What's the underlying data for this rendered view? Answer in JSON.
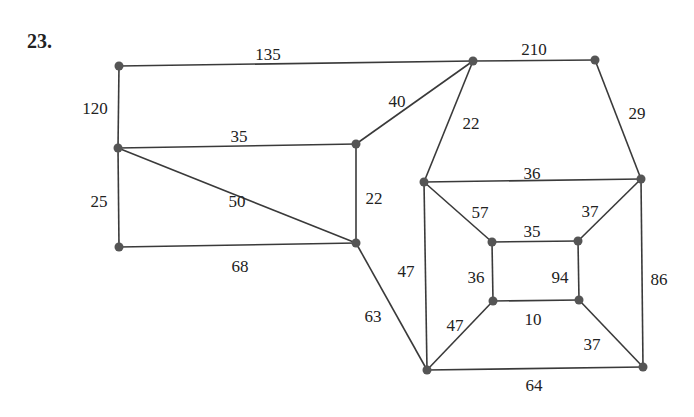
{
  "problem": {
    "number": "23."
  },
  "colors": {
    "edge": "#3a3a3a",
    "node": "#555555",
    "text": "#222222",
    "background": "#ffffff"
  },
  "graph": {
    "nodes": [
      {
        "id": "A",
        "x": 119,
        "y": 66
      },
      {
        "id": "B",
        "x": 473,
        "y": 61
      },
      {
        "id": "C",
        "x": 595,
        "y": 60
      },
      {
        "id": "D",
        "x": 118,
        "y": 148
      },
      {
        "id": "E",
        "x": 356,
        "y": 144
      },
      {
        "id": "F",
        "x": 424,
        "y": 182
      },
      {
        "id": "G",
        "x": 641,
        "y": 179
      },
      {
        "id": "H",
        "x": 119,
        "y": 247
      },
      {
        "id": "I",
        "x": 356,
        "y": 243
      },
      {
        "id": "J",
        "x": 492,
        "y": 242
      },
      {
        "id": "K",
        "x": 578,
        "y": 241
      },
      {
        "id": "L",
        "x": 493,
        "y": 301
      },
      {
        "id": "M",
        "x": 579,
        "y": 300
      },
      {
        "id": "N",
        "x": 427,
        "y": 370
      },
      {
        "id": "O",
        "x": 643,
        "y": 367
      }
    ],
    "edges": [
      {
        "from": "A",
        "to": "B",
        "weight": "135",
        "lx": 268,
        "ly": 56
      },
      {
        "from": "B",
        "to": "C",
        "weight": "210",
        "lx": 534,
        "ly": 51
      },
      {
        "from": "A",
        "to": "D",
        "weight": "120",
        "lx": 95,
        "ly": 110
      },
      {
        "from": "B",
        "to": "E",
        "weight": "40",
        "lx": 397,
        "ly": 103
      },
      {
        "from": "B",
        "to": "F",
        "weight": "22",
        "lx": 471,
        "ly": 125
      },
      {
        "from": "C",
        "to": "G",
        "weight": "29",
        "lx": 637,
        "ly": 115
      },
      {
        "from": "D",
        "to": "E",
        "weight": "35",
        "lx": 239,
        "ly": 138
      },
      {
        "from": "D",
        "to": "I",
        "weight": "50",
        "lx": 237,
        "ly": 203
      },
      {
        "from": "D",
        "to": "H",
        "weight": "25",
        "lx": 99,
        "ly": 203
      },
      {
        "from": "E",
        "to": "I",
        "weight": "22",
        "lx": 374,
        "ly": 200
      },
      {
        "from": "H",
        "to": "I",
        "weight": "68",
        "lx": 240,
        "ly": 268
      },
      {
        "from": "F",
        "to": "G",
        "weight": "36",
        "lx": 532,
        "ly": 175
      },
      {
        "from": "F",
        "to": "J",
        "weight": "57",
        "lx": 480,
        "ly": 214
      },
      {
        "from": "G",
        "to": "K",
        "weight": "37",
        "lx": 590,
        "ly": 213
      },
      {
        "from": "F",
        "to": "N",
        "weight": "47",
        "lx": 406,
        "ly": 273
      },
      {
        "from": "I",
        "to": "N",
        "weight": "63",
        "lx": 373,
        "ly": 318
      },
      {
        "from": "J",
        "to": "K",
        "weight": "35",
        "lx": 532,
        "ly": 233
      },
      {
        "from": "J",
        "to": "L",
        "weight": "36",
        "lx": 476,
        "ly": 279
      },
      {
        "from": "K",
        "to": "M",
        "weight": "94",
        "lx": 560,
        "ly": 279
      },
      {
        "from": "G",
        "to": "O",
        "weight": "86",
        "lx": 659,
        "ly": 281
      },
      {
        "from": "L",
        "to": "M",
        "weight": "10",
        "lx": 533,
        "ly": 321
      },
      {
        "from": "L",
        "to": "N",
        "weight": "47",
        "lx": 455,
        "ly": 327
      },
      {
        "from": "M",
        "to": "O",
        "weight": "37",
        "lx": 592,
        "ly": 346
      },
      {
        "from": "N",
        "to": "O",
        "weight": "64",
        "lx": 534,
        "ly": 387
      }
    ]
  }
}
